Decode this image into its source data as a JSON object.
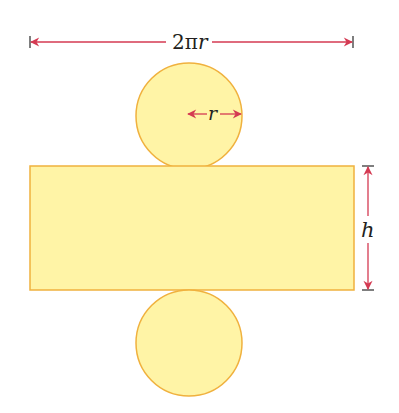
{
  "diagram": {
    "labels": {
      "circumference": "2πr",
      "circumference_num": "2π",
      "circumference_var": "r",
      "radius": "r",
      "height": "h"
    },
    "colors": {
      "fill": "#FFF4A6",
      "stroke": "#F0B13E",
      "arrow": "#D43A52",
      "tick": "#3a3a3a"
    },
    "shapes": {
      "top_circle": {
        "cx": 189,
        "cy": 116,
        "r": 53
      },
      "rectangle": {
        "x": 30,
        "y": 166,
        "width": 324,
        "height": 124
      },
      "bottom_circle": {
        "cx": 189,
        "cy": 343,
        "r": 53
      }
    }
  }
}
